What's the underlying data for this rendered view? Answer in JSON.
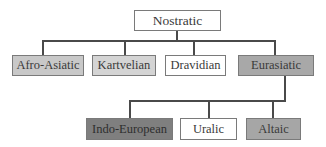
{
  "diagram": {
    "type": "tree",
    "root": {
      "label": "Nostratic",
      "fill": "#ffffff",
      "children": [
        {
          "label": "Afro-Asiatic",
          "fill": "#c8c8c8"
        },
        {
          "label": "Kartvelian",
          "fill": "#d4d4d4"
        },
        {
          "label": "Dravidian",
          "fill": "#ffffff"
        },
        {
          "label": "Eurasiatic",
          "fill": "#a8a8a8",
          "children": [
            {
              "label": "Indo-European",
              "fill": "#7f7f7f"
            },
            {
              "label": "Uralic",
              "fill": "#ffffff"
            },
            {
              "label": "Altaic",
              "fill": "#a6a6a6"
            }
          ]
        }
      ]
    }
  },
  "nodes": {
    "nostratic": "Nostratic",
    "afro_asiatic": "Afro-Asiatic",
    "kartvelian": "Kartvelian",
    "dravidian": "Dravidian",
    "eurasiatic": "Eurasiatic",
    "indo_european": "Indo-European",
    "uralic": "Uralic",
    "altaic": "Altaic"
  },
  "colors": {
    "line": "#4a4a4a",
    "border": "#7a7a7a",
    "text": "#3a3a3a",
    "light_gray": "#d4d4d4",
    "mid_gray": "#a8a8a8",
    "dark_gray": "#7f7f7f",
    "white": "#ffffff"
  }
}
